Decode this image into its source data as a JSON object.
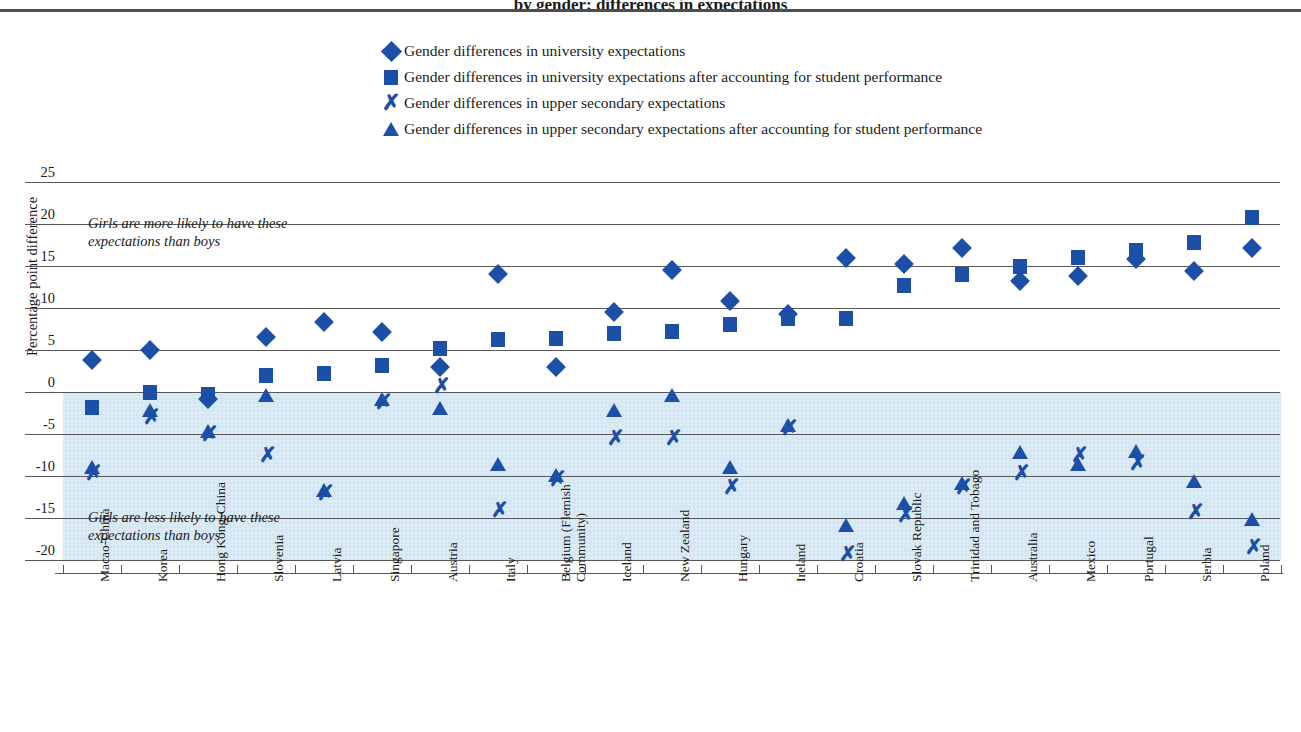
{
  "title_sliver": "by gender: differences in expectations",
  "legend": [
    {
      "marker": "diamond-icon",
      "label": "Gender differences in university expectations"
    },
    {
      "marker": "square-icon",
      "label": "Gender differences in university expectations after accounting for student performance"
    },
    {
      "marker": "x-icon",
      "label": "Gender differences in upper secondary expectations"
    },
    {
      "marker": "triangle-icon",
      "label": "Gender differences in upper secondary expectations after accounting for student performance"
    }
  ],
  "notes": {
    "upper": "Girls are more likely to have these\nexpectations than boys",
    "lower": "Girls are less likely to have these\nexpectations than boys"
  },
  "colors": {
    "marker": "#1c4fa8",
    "band": "#d6e7f4",
    "grid": "#58585c",
    "rule": "#4d4d52"
  },
  "chart_data": {
    "type": "scatter",
    "title": "",
    "xlabel": "",
    "ylabel": "Percentage point difference",
    "ylim": [
      -20,
      25
    ],
    "yticks": [
      25,
      20,
      15,
      10,
      5,
      0,
      -5,
      -10,
      -15,
      -20
    ],
    "ytick_labels": [
      "25",
      "20",
      "15",
      "10",
      "5",
      "0",
      "-5",
      "-10",
      "-15",
      "-20"
    ],
    "grid": true,
    "legend_position": "top",
    "shaded_region": {
      "from": 0,
      "to": -20,
      "meaning": "Girls are less likely"
    },
    "categories": [
      "Macao-China",
      "Korea",
      "Hong Kong-China",
      "Slovenia",
      "Latvia",
      "Singapore",
      "Austria",
      "Italy",
      "Belgium (Flemish\nCommunity)",
      "Iceland",
      "New Zealand",
      "Hungary",
      "Ireland",
      "Croatia",
      "Slovak Republic",
      "Trinidad and Tobago",
      "Australia",
      "Mexico",
      "Portugal",
      "Serbia",
      "Poland"
    ],
    "series": [
      {
        "name": "Gender differences in university expectations",
        "marker": "diamond",
        "values": [
          3.8,
          5.0,
          -0.8,
          6.5,
          8.3,
          7.1,
          3.0,
          14.0,
          3.0,
          9.5,
          14.5,
          10.8,
          9.3,
          16.0,
          15.2,
          17.2,
          13.2,
          13.8,
          15.8,
          14.4,
          17.2
        ]
      },
      {
        "name": "Gender differences in university expectations after accounting for student performance",
        "marker": "square",
        "values": [
          -1.8,
          0.0,
          -0.3,
          2.0,
          2.2,
          3.2,
          5.2,
          6.2,
          6.4,
          7.0,
          7.2,
          8.0,
          8.8,
          8.7,
          12.7,
          14.0,
          15.0,
          16.0,
          16.9,
          17.8,
          20.8
        ]
      },
      {
        "name": "Gender differences in upper secondary expectations",
        "marker": "x",
        "values": [
          -9.6,
          -3.0,
          -5.0,
          -7.5,
          -12.0,
          -1.2,
          0.7,
          -14.0,
          -10.3,
          -5.5,
          -5.5,
          -11.3,
          -4.3,
          -19.3,
          -14.7,
          -11.3,
          -9.7,
          -7.5,
          -8.4,
          -14.3,
          -18.4
        ]
      },
      {
        "name": "Gender differences in upper secondary expectations after accounting for student performance",
        "marker": "triangle",
        "values": [
          -9.0,
          -2.3,
          -4.8,
          -0.5,
          -11.8,
          -1.0,
          -2.0,
          -8.7,
          -10.0,
          -2.3,
          -0.5,
          -9.0,
          -4.0,
          -16.0,
          -13.3,
          -11.0,
          -7.3,
          -8.7,
          -7.1,
          -10.7,
          -15.2
        ]
      }
    ]
  }
}
